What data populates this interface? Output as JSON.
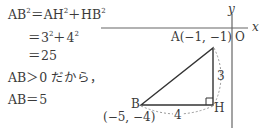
{
  "solution": {
    "line1": {
      "lhs": "AB",
      "eq": "＝AH",
      "plus": "＋HB",
      "exp": "2"
    },
    "line2": {
      "text_a": "＝3",
      "text_b": "＋4",
      "exp": "2"
    },
    "line3": "＝25",
    "line4": "AB＞0 だから，",
    "line5": "AB＝5"
  },
  "figure": {
    "axis_x_label": "x",
    "axis_y_label": "y",
    "origin_label": "O",
    "point_A": "A(−1, −1)",
    "point_B": "B",
    "point_B_coords": "(−5, −4)",
    "point_H": "H",
    "side_AH": "3",
    "side_BH": "4"
  },
  "colors": {
    "stroke": "#333333",
    "axis": "#666666",
    "dashed": "#999999",
    "text": "#3a3a3a"
  }
}
